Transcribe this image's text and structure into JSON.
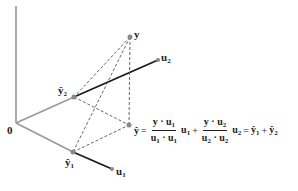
{
  "diagram": {
    "colors": {
      "axis": "#888888",
      "vector_light": "#999999",
      "vector_dark": "#1a1a1a",
      "dashed": "#555555",
      "point": "#888888",
      "text": "#222222"
    },
    "points": {
      "origin": {
        "x": 16,
        "y": 123,
        "label": "0"
      },
      "y": {
        "x": 130,
        "y": 37,
        "label": "y"
      },
      "y_hat_2": {
        "x": 74,
        "y": 97,
        "label": "ŷ",
        "sub": "2"
      },
      "u2": {
        "x": 158,
        "y": 60,
        "label": "u",
        "sub": "2"
      },
      "y_hat": {
        "x": 129,
        "y": 125,
        "label": "ŷ"
      },
      "y_hat_1": {
        "x": 73,
        "y": 152,
        "label": "ŷ",
        "sub": "1"
      },
      "u1": {
        "x": 112,
        "y": 169,
        "label": "u",
        "sub": "1"
      }
    },
    "formula": {
      "lhs": "ŷ",
      "equals": "=",
      "term1_num": "y · u",
      "term1_num_sub": "1",
      "term1_den": "u",
      "term1_den_sub_a": "1",
      "term1_den_dot": " · u",
      "term1_den_sub_b": "1",
      "term1_vec": "u",
      "term1_vec_sub": "1",
      "plus": "+",
      "term2_num": "y · u",
      "term2_num_sub": "2",
      "term2_den": "u",
      "term2_den_sub_a": "2",
      "term2_den_dot": " · u",
      "term2_den_sub_b": "2",
      "term2_vec": "u",
      "term2_vec_sub": "2",
      "equals2": "=",
      "r1": "ŷ",
      "r1_sub": "1",
      "plus2": "+",
      "r2": "ŷ",
      "r2_sub": "2"
    }
  }
}
